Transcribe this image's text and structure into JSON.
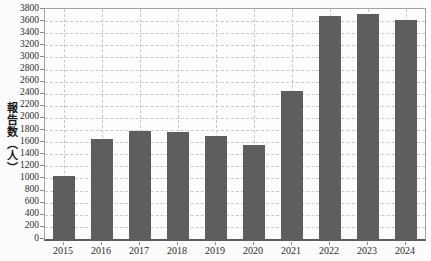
{
  "chart_data": {
    "type": "bar",
    "title": "",
    "categories": [
      "2015",
      "2016",
      "2017",
      "2018",
      "2019",
      "2020",
      "2021",
      "2022",
      "2023",
      "2024"
    ],
    "values": [
      1040,
      1660,
      1780,
      1760,
      1700,
      1550,
      2450,
      3680,
      3710,
      3620
    ],
    "xlabel": "",
    "ylabel": "報告数（人）",
    "ylim": [
      0,
      3800
    ],
    "ytick_step": 200,
    "legend": "none",
    "grid": "dashed horizontal and vertical",
    "colors": {
      "bar": "#5e5e5e",
      "gridline": "#c9c9c9",
      "frame": "#a3a3a3",
      "axis": "#5c5c5c",
      "tick": "#8a8a8a",
      "text": "#2b2b2b",
      "background": "#fcfcfc"
    }
  }
}
